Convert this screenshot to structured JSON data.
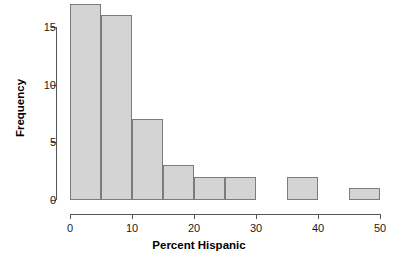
{
  "chart_data": {
    "type": "bar",
    "title": "",
    "subtitle": "",
    "xlabel": "Percent Hispanic",
    "ylabel": "Frequency",
    "xlim": [
      0,
      50
    ],
    "ylim": [
      0,
      17
    ],
    "xticks": [
      0,
      10,
      20,
      30,
      40,
      50
    ],
    "xtick_labels": [
      "0",
      "10",
      "20",
      "30",
      "40",
      "50"
    ],
    "yticks": [
      0,
      5,
      10,
      15
    ],
    "ytick_labels": [
      "0",
      "5",
      "10",
      "15"
    ],
    "grid": false,
    "legend": null,
    "bin_width": 5,
    "bin_edges": [
      0,
      5,
      10,
      15,
      20,
      25,
      30,
      35,
      40,
      45,
      50
    ],
    "categories": [
      "0-5",
      "5-10",
      "10-15",
      "15-20",
      "20-25",
      "25-30",
      "30-35",
      "35-40",
      "40-45",
      "45-50"
    ],
    "values": [
      17,
      16,
      7,
      3,
      2,
      2,
      0,
      2,
      0,
      1
    ],
    "bars": [
      {
        "label": "0-5",
        "x0": 0,
        "x1": 5,
        "value": 17
      },
      {
        "label": "5-10",
        "x0": 5,
        "x1": 10,
        "value": 16
      },
      {
        "label": "10-15",
        "x0": 10,
        "x1": 15,
        "value": 7
      },
      {
        "label": "15-20",
        "x0": 15,
        "x1": 20,
        "value": 3
      },
      {
        "label": "20-25",
        "x0": 20,
        "x1": 25,
        "value": 2
      },
      {
        "label": "25-30",
        "x0": 25,
        "x1": 30,
        "value": 2
      },
      {
        "label": "30-35",
        "x0": 30,
        "x1": 35,
        "value": 0
      },
      {
        "label": "35-40",
        "x0": 35,
        "x1": 40,
        "value": 2
      },
      {
        "label": "40-45",
        "x0": 40,
        "x1": 45,
        "value": 0
      },
      {
        "label": "45-50",
        "x0": 45,
        "x1": 50,
        "value": 1
      }
    ],
    "colors": {
      "bar_fill": "#d4d4d4",
      "bar_border": "#7c7c7c",
      "axis": "#555555",
      "text": "#1a1a1a",
      "background": "#ffffff"
    }
  }
}
